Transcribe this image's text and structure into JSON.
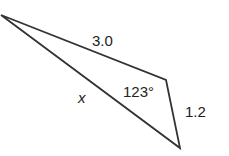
{
  "diagram": {
    "type": "triangle",
    "vertices": {
      "A": [
        1,
        15
      ],
      "B": [
        166,
        80
      ],
      "C": [
        180,
        148
      ]
    },
    "sides": [
      {
        "from": "A",
        "to": "B",
        "label": "3.0"
      },
      {
        "from": "B",
        "to": "C",
        "label": "1.2"
      },
      {
        "from": "A",
        "to": "C",
        "label": "x"
      }
    ],
    "angles": [
      {
        "vertex": "B",
        "label": "123°"
      }
    ],
    "stroke_color": "#333333"
  }
}
